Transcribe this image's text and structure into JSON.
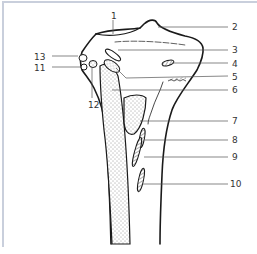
{
  "figure": {
    "type": "anatomical line drawing",
    "colors": {
      "line": "#1a1a1a",
      "leader": "#555555",
      "frame": "#c9cfdc",
      "label": "#333333"
    }
  },
  "labels": [
    {
      "id": "1",
      "text": "1",
      "x": 111,
      "y": 11
    },
    {
      "id": "2",
      "text": "2",
      "x": 232,
      "y": 22
    },
    {
      "id": "3",
      "text": "3",
      "x": 232,
      "y": 45
    },
    {
      "id": "4",
      "text": "4",
      "x": 232,
      "y": 59
    },
    {
      "id": "5",
      "text": "5",
      "x": 232,
      "y": 72
    },
    {
      "id": "6",
      "text": "6",
      "x": 232,
      "y": 85
    },
    {
      "id": "7",
      "text": "7",
      "x": 232,
      "y": 116
    },
    {
      "id": "8",
      "text": "8",
      "x": 232,
      "y": 135
    },
    {
      "id": "9",
      "text": "9",
      "x": 232,
      "y": 152
    },
    {
      "id": "10",
      "text": "10",
      "x": 230,
      "y": 179
    },
    {
      "id": "11",
      "text": "11",
      "x": 34,
      "y": 63
    },
    {
      "id": "12",
      "text": "12",
      "x": 88,
      "y": 100
    },
    {
      "id": "13",
      "text": "13",
      "x": 34,
      "y": 52
    }
  ]
}
